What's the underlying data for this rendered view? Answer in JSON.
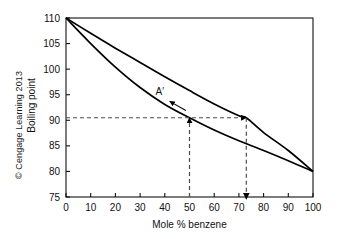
{
  "figure": {
    "copyright": "© Cengage Learning 2013",
    "curve_label": "A′"
  },
  "chart_data": {
    "type": "line",
    "title": "",
    "xlabel": "Mole % benzene",
    "ylabel": "Boiling point",
    "xlim": [
      0,
      100
    ],
    "ylim": [
      75,
      110
    ],
    "xticks": [
      0,
      10,
      20,
      30,
      40,
      50,
      60,
      70,
      80,
      90,
      100
    ],
    "yticks": [
      75,
      80,
      85,
      90,
      95,
      100,
      105,
      110
    ],
    "xtick_labels": [
      "0",
      "10",
      "20",
      "30",
      "40",
      "50",
      "60",
      "70",
      "80",
      "90",
      "100"
    ],
    "ytick_labels": [
      "75",
      "80",
      "85",
      "90",
      "95",
      "100",
      "105",
      "110"
    ],
    "grid": false,
    "legend": "none",
    "line_color": "#000000",
    "dash_color": "#4d4d4d",
    "series": [
      {
        "name": "vapor-curve",
        "note": "upper curve (vapor composition)",
        "x": [
          0,
          10,
          20,
          30,
          40,
          50,
          60,
          70,
          73,
          80,
          90,
          100
        ],
        "y": [
          110.0,
          107.0,
          104.1,
          101.3,
          98.5,
          95.8,
          93.2,
          90.9,
          90.5,
          87.6,
          84.1,
          80.0
        ]
      },
      {
        "name": "liquid-curve",
        "note": "lower curve (liquid composition)",
        "x": [
          0,
          10,
          20,
          30,
          40,
          50,
          60,
          70,
          80,
          90,
          100
        ],
        "y": [
          110.0,
          105.0,
          100.4,
          96.4,
          93.1,
          90.5,
          88.1,
          86.0,
          84.1,
          82.1,
          80.0
        ]
      }
    ],
    "annotations": [
      {
        "name": "tie-line",
        "type": "dashed-horizontal",
        "y": 90.5,
        "x_start": 0,
        "x_end": 73,
        "arrow": "right-at-73"
      },
      {
        "name": "liquid-composition-drop",
        "type": "dashed-vertical",
        "x": 50,
        "y_start": 75,
        "y_end": 90.5,
        "arrow": "up-at-90.5"
      },
      {
        "name": "vapor-composition-drop",
        "type": "dashed-vertical",
        "x": 73,
        "y_start": 90.5,
        "y_end": 75,
        "arrow": "down-at-75"
      },
      {
        "name": "label-A-prime",
        "type": "label-with-arrow",
        "text": "A′",
        "x": 38,
        "y": 95.0
      }
    ]
  }
}
